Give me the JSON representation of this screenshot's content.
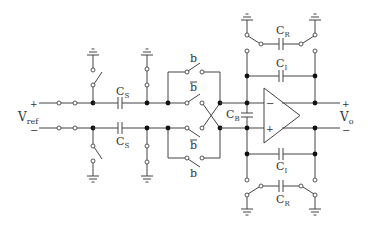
{
  "diagram": {
    "labels": {
      "vref": "V",
      "vref_sub": "ref",
      "vo": "V",
      "vo_sub": "o",
      "plus": "+",
      "minus": "−",
      "cs_top": "C",
      "cs_bot": "C",
      "cs_sub": "S",
      "cb": "C",
      "cb_sub": "B",
      "ci_top": "C",
      "ci_bot": "C",
      "ci_sub": "I",
      "cr_top": "C",
      "cr_bot": "C",
      "cr_sub": "R",
      "b": "b",
      "b_bar": "b",
      "opamp_minus": "−",
      "opamp_plus": "+"
    }
  }
}
